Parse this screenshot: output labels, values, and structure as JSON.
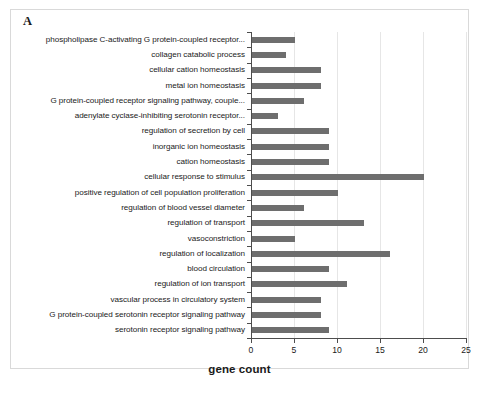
{
  "figure": {
    "panel_letter": "A"
  },
  "chart_data": {
    "type": "bar",
    "orientation": "horizontal",
    "title": "",
    "xlabel": "gene count",
    "ylabel": "",
    "xlim": [
      0,
      25
    ],
    "xticks": [
      0,
      5,
      10,
      15,
      20,
      25
    ],
    "grid": "vertical",
    "legend": "none",
    "bar_color": "#6e6e6e",
    "categories": [
      "phospholipase C-activating G protein-coupled receptor...",
      "collagen catabolic process",
      "cellular cation homeostasis",
      "metal ion homeostasis",
      "G protein-coupled receptor signaling pathway, couple...",
      "adenylate cyclase-inhibiting serotonin receptor...",
      "regulation of secretion by cell",
      "inorganic ion homeostasis",
      "cation homeostasis",
      "cellular response to stimulus",
      "positive regulation of cell population proliferation",
      "regulation of blood vessel diameter",
      "regulation of transport",
      "vasoconstriction",
      "regulation of localization",
      "blood circulation",
      "regulation of ion transport",
      "vascular process in circulatory system",
      "G protein-coupled serotonin receptor signaling pathway",
      "serotonin receptor signaling pathway"
    ],
    "values": [
      5,
      4,
      8,
      8,
      6,
      3,
      9,
      9,
      9,
      20,
      10,
      6,
      13,
      5,
      16,
      9,
      11,
      8,
      8,
      9
    ]
  }
}
